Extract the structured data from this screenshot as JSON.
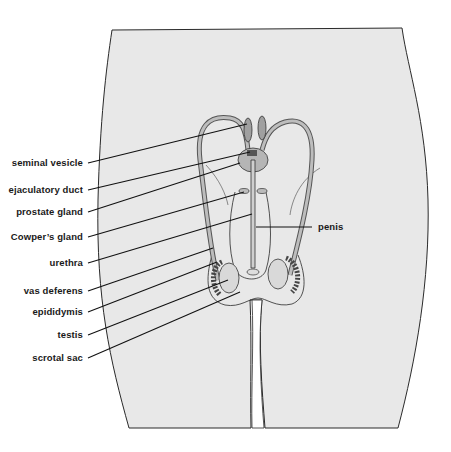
{
  "figure": {
    "colors": {
      "body_fill": "#e8e8e8",
      "outline": "#2a2a2a",
      "organ_fill": "#b5b5b5",
      "organ_dark": "#6e6e6e",
      "leader_line": "#111111",
      "background": "#ffffff"
    },
    "labels_left": [
      {
        "text": "seminal vesicle",
        "y": 163
      },
      {
        "text": "ejaculatory duct",
        "y": 190
      },
      {
        "text": "prostate gland",
        "y": 212
      },
      {
        "text": "Cowper’s gland",
        "y": 237
      },
      {
        "text": "urethra",
        "y": 263
      },
      {
        "text": "vas deferens",
        "y": 291
      },
      {
        "text": "epididymis",
        "y": 312
      },
      {
        "text": "testis",
        "y": 335
      },
      {
        "text": "scrotal sac",
        "y": 358
      }
    ],
    "labels_right": [
      {
        "text": "penis",
        "y": 227
      }
    ]
  }
}
